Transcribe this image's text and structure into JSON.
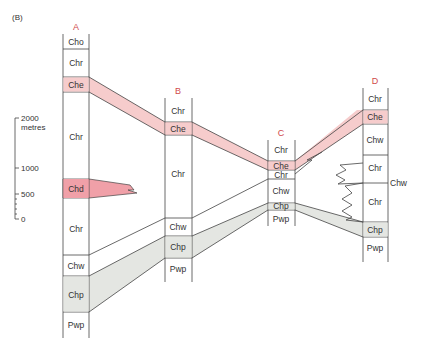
{
  "figure": {
    "panel_label": "(B)",
    "colors": {
      "red_accent": "#d04a4a",
      "pink_fill": "#f6cccc",
      "pink_strong": "#f0a0a8",
      "grey_fill": "#e4e6e2",
      "line": "#444444"
    }
  },
  "scale_bar": {
    "ticks": [
      "2000",
      "1000",
      "500",
      "0"
    ],
    "unit": "metres"
  },
  "columns": {
    "A": {
      "title": "A",
      "units": [
        "Cho",
        "Chr",
        "Che",
        "Chr",
        "Chd",
        "Chr",
        "Chw",
        "Chp",
        "Pwp"
      ]
    },
    "B": {
      "title": "B",
      "units": [
        "Chr",
        "Che",
        "Chr",
        "Chw",
        "Chp",
        "Pwp"
      ]
    },
    "C": {
      "title": "C",
      "units": [
        "Chr",
        "Che",
        "Chr",
        "Chw",
        "Chp",
        "Pwp"
      ]
    },
    "D": {
      "title": "D",
      "units": [
        "Chr",
        "Che",
        "Chw",
        "Chr",
        "Chr",
        "Chp",
        "Pwp"
      ],
      "side_label": "Chw"
    }
  }
}
